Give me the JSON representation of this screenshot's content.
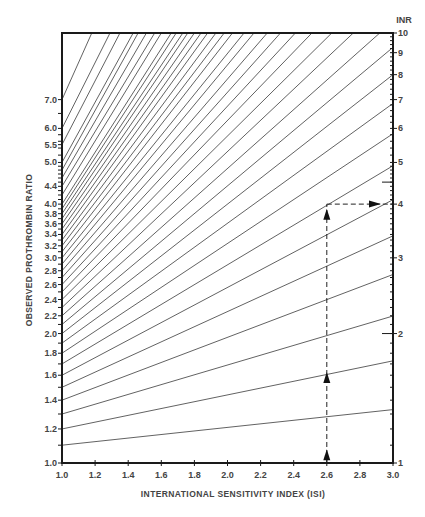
{
  "chart_data": {
    "type": "line",
    "title": "",
    "xlabel": "INTERNATIONAL SENSITIVITY INDEX (ISI)",
    "ylabel": "OBSERVED PROTHROMBIN RATIO",
    "y2label": "INR",
    "xlim": [
      1.0,
      3.0
    ],
    "ylim": [
      1.0,
      10.0
    ],
    "yscale": "log",
    "grid": false,
    "legend": null,
    "relation": "INR = ratio ^ ISI",
    "x_ticks": [
      "1.0",
      "1.2",
      "1.4",
      "1.6",
      "1.8",
      "2.0",
      "2.2",
      "2.4",
      "2.6",
      "2.8",
      "3.0"
    ],
    "y_ticks_left": [
      "1.0",
      "1.2",
      "1.4",
      "1.6",
      "1.8",
      "2.0",
      "2.2",
      "2.4",
      "2.6",
      "2.8",
      "3.0",
      "3.2",
      "3.4",
      "3.6",
      "3.8",
      "4.0",
      "4.4",
      "5.0",
      "5.5",
      "6.0",
      "7.0"
    ],
    "y_ticks_right": [
      "1",
      "2",
      "3",
      "4",
      "5",
      "6",
      "7",
      "8",
      "9",
      "10"
    ],
    "series": [
      {
        "name": "ratio 1.1",
        "x": [
          1.0,
          3.0
        ],
        "y": [
          1.1,
          1.331
        ]
      },
      {
        "name": "ratio 1.2",
        "x": [
          1.0,
          3.0
        ],
        "y": [
          1.2,
          1.728
        ]
      },
      {
        "name": "ratio 1.3",
        "x": [
          1.0,
          3.0
        ],
        "y": [
          1.3,
          2.197
        ]
      },
      {
        "name": "ratio 1.4",
        "x": [
          1.0,
          3.0
        ],
        "y": [
          1.4,
          2.744
        ]
      },
      {
        "name": "ratio 1.5",
        "x": [
          1.0,
          3.0
        ],
        "y": [
          1.5,
          3.375
        ]
      },
      {
        "name": "ratio 1.6",
        "x": [
          1.0,
          3.0
        ],
        "y": [
          1.6,
          4.096
        ]
      },
      {
        "name": "ratio 1.7",
        "x": [
          1.0,
          3.0
        ],
        "y": [
          1.7,
          4.913
        ]
      },
      {
        "name": "ratio 1.8",
        "x": [
          1.0,
          3.0
        ],
        "y": [
          1.8,
          5.832
        ]
      },
      {
        "name": "ratio 1.9",
        "x": [
          1.0,
          3.0
        ],
        "y": [
          1.9,
          6.859
        ]
      },
      {
        "name": "ratio 2.0",
        "x": [
          1.0,
          3.0
        ],
        "y": [
          2.0,
          8.0
        ]
      },
      {
        "name": "ratio 2.1",
        "x": [
          1.0,
          3.0
        ],
        "y": [
          2.1,
          9.261
        ]
      },
      {
        "name": "ratio 2.2",
        "x": [
          1.0,
          2.92
        ],
        "y": [
          2.2,
          10.0
        ]
      },
      {
        "name": "ratio 2.3",
        "x": [
          1.0,
          2.76
        ],
        "y": [
          2.3,
          10.0
        ]
      },
      {
        "name": "ratio 2.4",
        "x": [
          1.0,
          2.63
        ],
        "y": [
          2.4,
          10.0
        ]
      },
      {
        "name": "ratio 2.5",
        "x": [
          1.0,
          2.51
        ],
        "y": [
          2.5,
          10.0
        ]
      },
      {
        "name": "ratio 2.6",
        "x": [
          1.0,
          2.41
        ],
        "y": [
          2.6,
          10.0
        ]
      },
      {
        "name": "ratio 2.7",
        "x": [
          1.0,
          2.32
        ],
        "y": [
          2.7,
          10.0
        ]
      },
      {
        "name": "ratio 2.8",
        "x": [
          1.0,
          2.24
        ],
        "y": [
          2.8,
          10.0
        ]
      },
      {
        "name": "ratio 2.9",
        "x": [
          1.0,
          2.16
        ],
        "y": [
          2.9,
          10.0
        ]
      },
      {
        "name": "ratio 3.0",
        "x": [
          1.0,
          2.1
        ],
        "y": [
          3.0,
          10.0
        ]
      },
      {
        "name": "ratio 3.1",
        "x": [
          1.0,
          2.03
        ],
        "y": [
          3.1,
          10.0
        ]
      },
      {
        "name": "ratio 3.2",
        "x": [
          1.0,
          1.98
        ],
        "y": [
          3.2,
          10.0
        ]
      },
      {
        "name": "ratio 3.3",
        "x": [
          1.0,
          1.93
        ],
        "y": [
          3.3,
          10.0
        ]
      },
      {
        "name": "ratio 3.4",
        "x": [
          1.0,
          1.88
        ],
        "y": [
          3.4,
          10.0
        ]
      },
      {
        "name": "ratio 3.5",
        "x": [
          1.0,
          1.84
        ],
        "y": [
          3.5,
          10.0
        ]
      },
      {
        "name": "ratio 3.6",
        "x": [
          1.0,
          1.8
        ],
        "y": [
          3.6,
          10.0
        ]
      },
      {
        "name": "ratio 3.7",
        "x": [
          1.0,
          1.76
        ],
        "y": [
          3.7,
          10.0
        ]
      },
      {
        "name": "ratio 3.8",
        "x": [
          1.0,
          1.73
        ],
        "y": [
          3.8,
          10.0
        ]
      },
      {
        "name": "ratio 3.9",
        "x": [
          1.0,
          1.69
        ],
        "y": [
          3.9,
          10.0
        ]
      },
      {
        "name": "ratio 4.0",
        "x": [
          1.0,
          1.66
        ],
        "y": [
          4.0,
          10.0
        ]
      },
      {
        "name": "ratio 4.2",
        "x": [
          1.0,
          1.6
        ],
        "y": [
          4.2,
          10.0
        ]
      },
      {
        "name": "ratio 4.4",
        "x": [
          1.0,
          1.56
        ],
        "y": [
          4.4,
          10.0
        ]
      },
      {
        "name": "ratio 4.6",
        "x": [
          1.0,
          1.51
        ],
        "y": [
          4.6,
          10.0
        ]
      },
      {
        "name": "ratio 4.8",
        "x": [
          1.0,
          1.46
        ],
        "y": [
          4.8,
          10.0
        ]
      },
      {
        "name": "ratio 5.0",
        "x": [
          1.0,
          1.43
        ],
        "y": [
          5.0,
          10.0
        ]
      },
      {
        "name": "ratio 5.5",
        "x": [
          1.0,
          1.35
        ],
        "y": [
          5.5,
          10.0
        ]
      },
      {
        "name": "ratio 6.0",
        "x": [
          1.0,
          1.29
        ],
        "y": [
          6.0,
          10.0
        ]
      },
      {
        "name": "ratio 7.0",
        "x": [
          1.0,
          1.18
        ],
        "y": [
          7.0,
          10.0
        ]
      }
    ],
    "annotations": [
      {
        "type": "dashed-arrow-path",
        "description": "Vertical dashed line at ISI 2.6 from bottom up to INR 4, then horizontal arrow right to INR axis",
        "x": 2.6,
        "inr": 4.0
      }
    ],
    "inner_ticks_right": [
      4.5,
      2.0
    ]
  },
  "colors": {
    "line": "#3a3a3a",
    "axis": "#1a1a1a",
    "text": "#444444",
    "background": "#ffffff"
  }
}
